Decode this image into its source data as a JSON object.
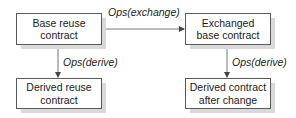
{
  "diagram": {
    "type": "flow",
    "nodes": [
      {
        "id": "base",
        "label_line1": "Base reuse",
        "label_line2": "contract"
      },
      {
        "id": "exchanged",
        "label_line1": "Exchanged",
        "label_line2": "base contract"
      },
      {
        "id": "derived",
        "label_line1": "Derived reuse",
        "label_line2": "contract"
      },
      {
        "id": "derived_after",
        "label_line1": "Derived contract",
        "label_line2": "after change"
      }
    ],
    "edges": [
      {
        "from": "base",
        "to": "exchanged",
        "label": "Ops(exchange)"
      },
      {
        "from": "base",
        "to": "derived",
        "label": "Ops(derive)"
      },
      {
        "from": "exchanged",
        "to": "derived_after",
        "label": "Ops(derive)"
      }
    ],
    "colors": {
      "border": "#5a5a5a",
      "shadow": "#d9d9d9",
      "line": "#444444"
    }
  }
}
